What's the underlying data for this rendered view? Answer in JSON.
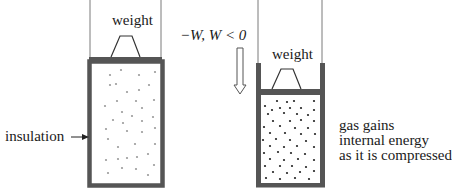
{
  "diagram": {
    "type": "adiabatic-compression",
    "left_cylinder": {
      "weight_label": "weight",
      "side_label": "insulation",
      "state": "expanded"
    },
    "process_arrow": {
      "label": "−W, W < 0",
      "direction": "down"
    },
    "right_cylinder": {
      "weight_label": "weight",
      "state": "compressed",
      "caption_lines": [
        "gas gains",
        "internal energy",
        "as it is compressed"
      ]
    },
    "colors": {
      "wall": "#555555",
      "rail": "#7a7a7a",
      "text": "#1a1a1a",
      "sparse_dot": "#9a9a9a",
      "dense_dot": "#222222"
    }
  }
}
